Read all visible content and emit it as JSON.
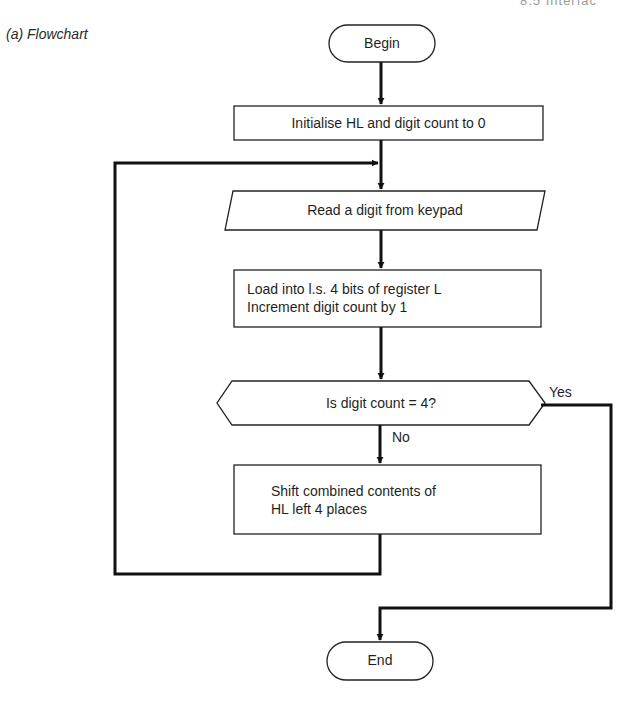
{
  "page": {
    "running_header": "8.5 Interfac",
    "caption": "(a) Flowchart"
  },
  "flowchart": {
    "nodes": [
      {
        "id": "begin",
        "type": "terminal",
        "label": "Begin"
      },
      {
        "id": "init",
        "type": "process",
        "label": "Initialise HL and digit count to 0"
      },
      {
        "id": "read",
        "type": "input-output",
        "label": "Read a digit from keypad"
      },
      {
        "id": "load",
        "type": "process",
        "lines": [
          "Load into l.s. 4 bits of register L",
          "Increment digit count by 1"
        ]
      },
      {
        "id": "decision",
        "type": "decision",
        "label": "Is digit count = 4?"
      },
      {
        "id": "shift",
        "type": "process",
        "lines": [
          "Shift combined contents of",
          "HL left 4 places"
        ]
      },
      {
        "id": "end",
        "type": "terminal",
        "label": "End"
      }
    ],
    "edges": [
      {
        "from": "begin",
        "to": "init",
        "label": ""
      },
      {
        "from": "init",
        "to": "read",
        "label": ""
      },
      {
        "from": "read",
        "to": "load",
        "label": ""
      },
      {
        "from": "load",
        "to": "decision",
        "label": ""
      },
      {
        "from": "decision",
        "to": "shift",
        "label": "No"
      },
      {
        "from": "decision",
        "to": "end",
        "label": "Yes"
      },
      {
        "from": "shift",
        "to": "read",
        "label": ""
      }
    ],
    "branch_labels": {
      "yes": "Yes",
      "no": "No"
    }
  },
  "colors": {
    "line": "#111111",
    "text": "#1f1f1f",
    "background": "#ffffff"
  }
}
